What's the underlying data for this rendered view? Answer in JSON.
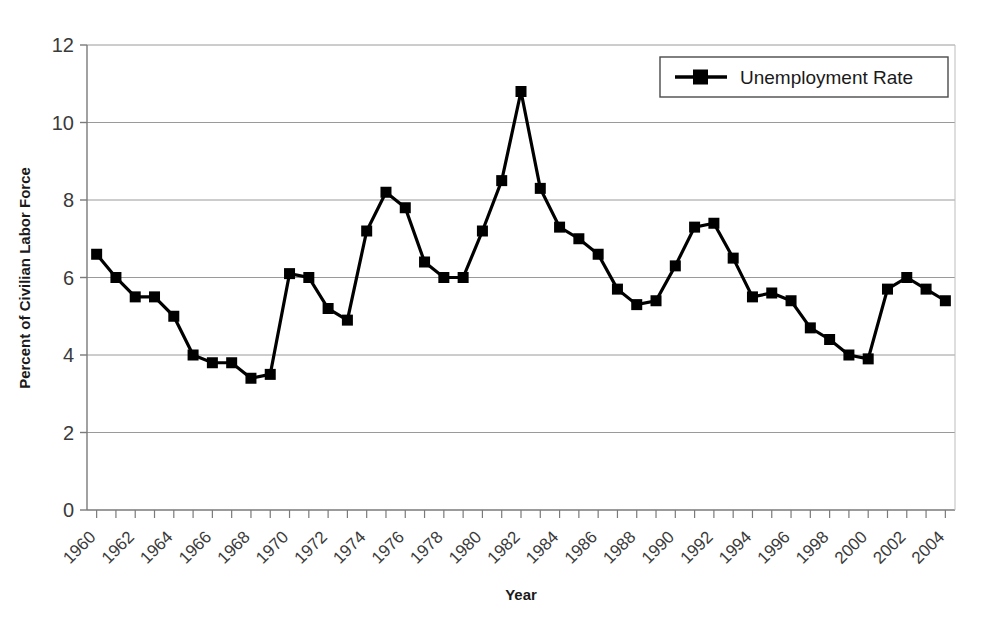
{
  "chart_data": {
    "type": "line",
    "title": "",
    "xlabel": "Year",
    "ylabel": "Percent of Civilian Labor Force",
    "xlim": [
      1959.5,
      2004.5
    ],
    "ylim": [
      0,
      12
    ],
    "y_ticks": [
      0,
      2,
      4,
      6,
      8,
      10,
      12
    ],
    "x_tick_labels": [
      "1960",
      "1962",
      "1964",
      "1966",
      "1968",
      "1970",
      "1972",
      "1974",
      "1976",
      "1978",
      "1980",
      "1982",
      "1984",
      "1986",
      "1988",
      "1990",
      "1992",
      "1994",
      "1996",
      "1998",
      "2000",
      "2002",
      "2004"
    ],
    "x_tick_label_rotation_deg": -45,
    "grid": "horizontal-only",
    "legend_position": "top-right",
    "marker": "square",
    "series": [
      {
        "name": "Unemployment Rate",
        "color": "#000000",
        "x": [
          1960,
          1961,
          1962,
          1963,
          1964,
          1965,
          1966,
          1967,
          1968,
          1969,
          1970,
          1971,
          1972,
          1973,
          1974,
          1975,
          1976,
          1977,
          1978,
          1979,
          1980,
          1981,
          1982,
          1983,
          1984,
          1985,
          1986,
          1987,
          1988,
          1989,
          1990,
          1991,
          1992,
          1993,
          1994,
          1995,
          1996,
          1997,
          1998,
          1999,
          2000,
          2001,
          2002,
          2003,
          2004
        ],
        "values": [
          6.6,
          6.0,
          5.5,
          5.5,
          5.0,
          4.0,
          3.8,
          3.8,
          3.4,
          3.5,
          6.1,
          6.0,
          5.2,
          4.9,
          7.2,
          8.2,
          7.8,
          6.4,
          6.0,
          6.0,
          7.2,
          8.5,
          10.8,
          8.3,
          7.3,
          7.0,
          6.6,
          5.7,
          5.3,
          5.4,
          6.3,
          7.3,
          7.4,
          6.5,
          5.5,
          5.6,
          5.4,
          4.7,
          4.4,
          4.0,
          3.9,
          5.7,
          6.0,
          5.7,
          5.4
        ]
      }
    ]
  },
  "legend": {
    "entries": [
      {
        "label": "Unemployment Rate"
      }
    ]
  },
  "colors": {
    "series": "#000000",
    "grid": "#9a9a9a",
    "axis": "#7a7a7a",
    "text": "#1a1a1a",
    "background": "#ffffff"
  }
}
